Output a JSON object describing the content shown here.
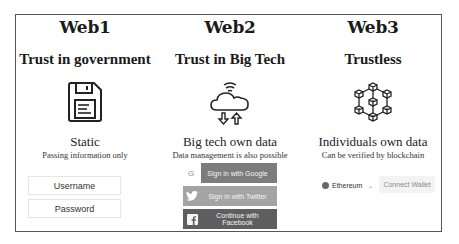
{
  "columns": [
    {
      "era": "Web1",
      "trust": "Trust in government",
      "icon": "floppy-disk-icon",
      "heading": "Static",
      "subheading": "Passing information only",
      "fields": {
        "username": "Username",
        "password": "Password"
      }
    },
    {
      "era": "Web2",
      "trust": "Trust in Big Tech",
      "icon": "cloud-sync-icon",
      "heading": "Big tech own data",
      "subheading": "Data management is also possible",
      "buttons": {
        "google": "Sign in with Google",
        "google_icon": "G",
        "twitter": "Sign in with Twitter",
        "facebook": "Continue with Facebook"
      }
    },
    {
      "era": "Web3",
      "trust": "Trustless",
      "icon": "blockchain-network-icon",
      "heading": "Individuals own data",
      "subheading": "Can be verified by blockchain",
      "network_selector": "Ethereum",
      "connect_wallet": "Connect Wallet"
    }
  ],
  "colors": {
    "frame": "#555555",
    "google_button": "#7c7c7c",
    "twitter_button": "#a4a4a4",
    "facebook_button": "#5e5e5e",
    "connect_button": "#f3f3f3"
  }
}
